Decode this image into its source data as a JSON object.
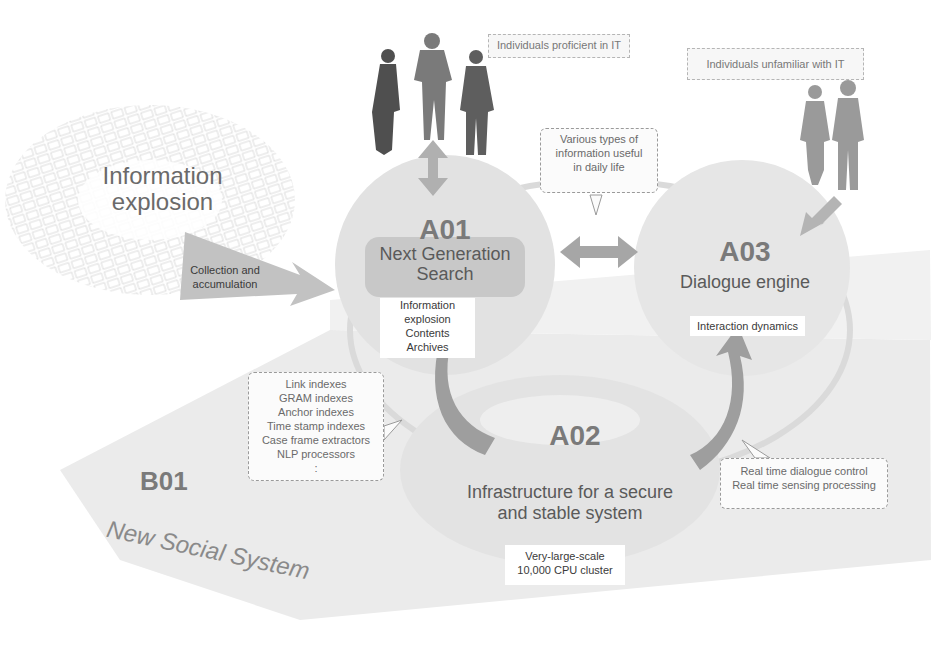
{
  "diagram": {
    "info_explosion": {
      "title_line1": "Information",
      "title_line2": "explosion",
      "arrow_label_line1": "Collection and",
      "arrow_label_line2": "accumulation"
    },
    "people": {
      "proficient_label": "Individuals proficient in IT",
      "unfamiliar_label": "Individuals unfamiliar with IT"
    },
    "callout_daily": {
      "line1": "Various types of",
      "line2": "information useful",
      "line3": "in daily life"
    },
    "a01": {
      "code": "A01",
      "title_line1": "Next Generation",
      "title_line2": "Search",
      "items": [
        "Information",
        "explosion",
        "Contents",
        "Archives"
      ]
    },
    "a03": {
      "code": "A03",
      "title": "Dialogue engine",
      "subtitle": "Interaction dynamics"
    },
    "a02": {
      "code": "A02",
      "title_line1": "Infrastructure for a secure",
      "title_line2": "and stable system",
      "cluster_line1": "Very-large-scale",
      "cluster_line2": "10,000 CPU cluster"
    },
    "indexes_callout": {
      "items": [
        "Link indexes",
        "GRAM indexes",
        "Anchor indexes",
        "Time stamp indexes",
        "Case frame extractors",
        "NLP processors",
        ":"
      ]
    },
    "realtime_callout": {
      "line1": "Real time dialogue control",
      "line2": "Real time sensing processing"
    },
    "b01": {
      "code": "B01",
      "title": "New Social System"
    },
    "colors": {
      "background": "#ffffff",
      "plane": "#e9e9e9",
      "circle": "#e3e3e3",
      "arrow": "#a8a8a8",
      "silhouette_dark": "#6b6b6b",
      "silhouette_light": "#9c9c9c",
      "text": "#5a5a5a"
    }
  }
}
